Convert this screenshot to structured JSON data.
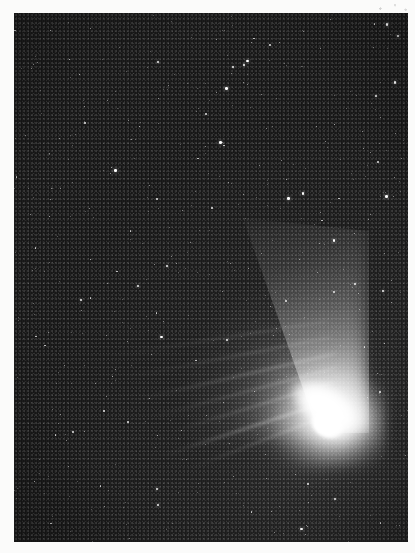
{
  "image": {
    "kind": "astrophotograph",
    "subject": "comet",
    "description": "Black and white photograph of a bright comet against a dense star field",
    "orientation": "portrait",
    "border": "white photographic print margin",
    "alt_text": "A bright comet with a saturated white nucleus and two tails streaming toward the upper left across a grainy star-filled night sky"
  },
  "photo": {
    "left": 14,
    "top": 13,
    "width": 394,
    "height": 529
  },
  "colors": {
    "sky_background": "#151515",
    "sky_glow": "#2a2a2a",
    "star": "#ffffff",
    "comet_core": "#ffffff",
    "paper_margin": "#fbfbfa"
  },
  "comet": {
    "nucleus": {
      "x": 325,
      "y": 430
    },
    "coma": {
      "x": 300,
      "y": 405,
      "width": 150,
      "height": 125
    },
    "tail_direction": "upper-left",
    "dust_tail": {
      "name": "dust-tail",
      "origin": {
        "x": 320,
        "y": 420
      },
      "end": {
        "x": 95,
        "y": 280
      },
      "width_at_end": 120,
      "brightness": "broad and diffuse"
    },
    "ion_tail_streaks": [
      {
        "x": 150,
        "y": 398,
        "length": 185,
        "angle": -18,
        "thickness": 3.0,
        "opacity": 0.75
      },
      {
        "x": 162,
        "y": 381,
        "length": 172,
        "angle": -17,
        "thickness": 2.4,
        "opacity": 0.62
      },
      {
        "x": 142,
        "y": 366,
        "length": 196,
        "angle": -15,
        "thickness": 2.2,
        "opacity": 0.52
      },
      {
        "x": 128,
        "y": 352,
        "length": 208,
        "angle": -13,
        "thickness": 2.6,
        "opacity": 0.46
      },
      {
        "x": 118,
        "y": 336,
        "length": 215,
        "angle": -11,
        "thickness": 2.0,
        "opacity": 0.38
      },
      {
        "x": 108,
        "y": 320,
        "length": 222,
        "angle": -9,
        "thickness": 1.8,
        "opacity": 0.3
      },
      {
        "x": 176,
        "y": 412,
        "length": 158,
        "angle": -21,
        "thickness": 2.2,
        "opacity": 0.55
      }
    ]
  },
  "starfield": {
    "count": 420,
    "description": "dense grainy field of faint and moderately bright stars"
  },
  "margin_marks": [
    {
      "name": "dust-speck",
      "x": 372,
      "y": 2,
      "width": 42,
      "height": 11
    }
  ]
}
